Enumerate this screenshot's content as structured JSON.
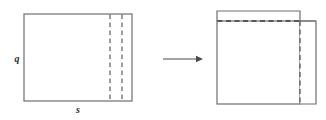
{
  "diagram": {
    "background_color": "#ffffff",
    "stroke_color": "#6e6e6e",
    "dash_color": "#5a5a5a",
    "label_color": "#2b2b2b",
    "left_figure": {
      "name": "source-rectangle",
      "x": 24,
      "y": 14,
      "width": 108,
      "height": 87,
      "labels": {
        "height_label": "q",
        "width_label": "s"
      },
      "dashed_vertical_lines": [
        {
          "name": "fold-line-inner",
          "x": 110
        },
        {
          "name": "fold-line-outer",
          "x": 122
        }
      ]
    },
    "arrow": {
      "name": "transform-arrow",
      "direction": "right",
      "x1": 163,
      "y1": 59,
      "x2": 203,
      "y2": 59
    },
    "right_figure": {
      "name": "folded-rectangle",
      "main_body": {
        "x": 217,
        "y": 21,
        "width": 83,
        "height": 83
      },
      "offset_flap": {
        "x": 300,
        "y": 11,
        "width": 16,
        "height": 93
      },
      "dashed_horizontal_line": {
        "name": "fold-crease-horizontal",
        "y": 21,
        "x1": 217,
        "x2": 300
      },
      "dashed_vertical_line": {
        "name": "fold-crease-vertical",
        "x": 300,
        "y1": 21,
        "y2": 104
      }
    }
  }
}
